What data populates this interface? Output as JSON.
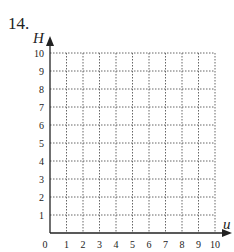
{
  "problem": {
    "number": "14."
  },
  "chart_data": {
    "type": "scatter",
    "title": "",
    "xlabel": "u",
    "ylabel": "H",
    "xlim": [
      0,
      10
    ],
    "ylim": [
      0,
      10
    ],
    "x_ticks": [
      "0",
      "1",
      "2",
      "3",
      "4",
      "5",
      "6",
      "7",
      "8",
      "9",
      "10"
    ],
    "y_ticks": [
      "1",
      "2",
      "3",
      "4",
      "5",
      "6",
      "7",
      "8",
      "9",
      "10"
    ],
    "grid": true,
    "grid_style": "dotted",
    "series": []
  },
  "colors": {
    "axis": "#222222",
    "grid": "#666666"
  }
}
